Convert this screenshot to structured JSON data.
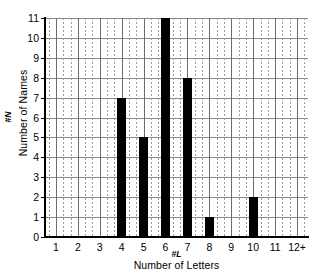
{
  "chart_data": {
    "type": "bar",
    "title": "",
    "subtitle": "",
    "xlabel": "Number of Letters",
    "xlabel_symbol": "#L",
    "ylabel": "Number of Names",
    "ylabel_symbol": "#N",
    "categories": [
      "1",
      "2",
      "3",
      "4",
      "5",
      "6",
      "7",
      "8",
      "9",
      "10",
      "11",
      "12+"
    ],
    "values": [
      0,
      0,
      0,
      7,
      5,
      11,
      8,
      1,
      0,
      2,
      0,
      0
    ],
    "xlim": [
      0.5,
      12.5
    ],
    "ylim": [
      0,
      11
    ],
    "ytick_labels": [
      "0",
      "1",
      "2",
      "3",
      "4",
      "5",
      "6",
      "7",
      "8",
      "9",
      "10",
      "11"
    ],
    "ytick_values": [
      0,
      1,
      2,
      3,
      4,
      5,
      6,
      7,
      8,
      9,
      10,
      11
    ],
    "grid": {
      "horizontal": true,
      "vertical_solid": true,
      "vertical_dotted": true,
      "minor_per_cell": 2
    },
    "legend": null,
    "legend_position": "none",
    "colors": {
      "bar": "#000000",
      "background": "#ffffff",
      "axis": "#000000",
      "gridline": "#8a8a8a",
      "gridline_minor": "#9a9a9a",
      "text": "#000000"
    }
  }
}
